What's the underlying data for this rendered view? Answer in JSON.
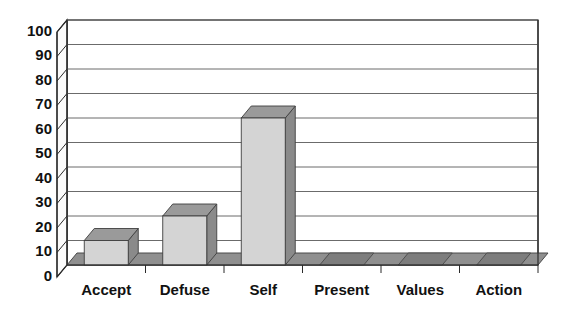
{
  "chart_data": {
    "type": "bar",
    "title": "",
    "subtitle": "",
    "xlabel": "",
    "ylabel": "",
    "categories": [
      "Accept",
      "Defuse",
      "Self",
      "Present",
      "Values",
      "Action"
    ],
    "values": [
      10,
      20,
      60,
      0,
      0,
      0
    ],
    "ylim": [
      0,
      100
    ],
    "ytick_labels": [
      "0",
      "10",
      "20",
      "30",
      "40",
      "50",
      "60",
      "70",
      "80",
      "90",
      "100"
    ],
    "ytick_values": [
      0,
      10,
      20,
      30,
      40,
      50,
      60,
      70,
      80,
      90,
      100
    ],
    "grid": true,
    "grid_axis": "y",
    "legend": false,
    "legend_position": "none",
    "style": "3d",
    "annotations": []
  },
  "colors": {
    "background": "#ffffff",
    "bar_front": "#d4d4d4",
    "bar_side": "#8a8a8a",
    "bar_top": "#9a9a9a",
    "floor": "#8f8f8f",
    "floor_edge": "#5c5c5c",
    "wall": "#ffffff",
    "wall_side": "#f2f2f2",
    "gridline": "#6b6b6b",
    "axis": "#2b2b2b",
    "text": "#111111"
  }
}
